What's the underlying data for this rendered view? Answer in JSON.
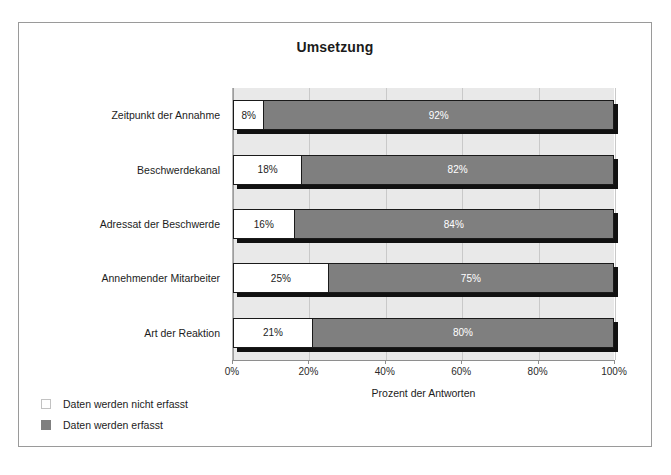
{
  "chart_data": {
    "type": "bar",
    "orientation": "horizontal",
    "stacked": true,
    "title": "Umsetzung",
    "xlabel": "Prozent der Antworten",
    "ylabel": "",
    "xlim": [
      0,
      100
    ],
    "xticks": [
      "0%",
      "20%",
      "40%",
      "60%",
      "80%",
      "100%"
    ],
    "xtick_values": [
      0,
      20,
      40,
      60,
      80,
      100
    ],
    "grid": true,
    "legend_position": "bottom-left",
    "categories": [
      "Zeitpunkt der Annahme",
      "Beschwerdekanal",
      "Adressat der Beschwerde",
      "Annehmender Mitarbeiter",
      "Art der Reaktion"
    ],
    "series": [
      {
        "name": "Daten werden nicht erfasst",
        "color": "#ffffff",
        "values": [
          8,
          18,
          16,
          25,
          21
        ],
        "labels": [
          "8%",
          "18%",
          "16%",
          "25%",
          "21%"
        ]
      },
      {
        "name": "Daten werden erfasst",
        "color": "#7f7f7f",
        "values": [
          92,
          82,
          84,
          75,
          80
        ],
        "labels": [
          "92%",
          "82%",
          "84%",
          "75%",
          "80%"
        ]
      }
    ]
  },
  "legend": {
    "items": [
      {
        "label": "Daten werden nicht erfasst",
        "swatch": "not-erfasst"
      },
      {
        "label": "Daten werden erfasst",
        "swatch": "erfasst"
      }
    ]
  }
}
